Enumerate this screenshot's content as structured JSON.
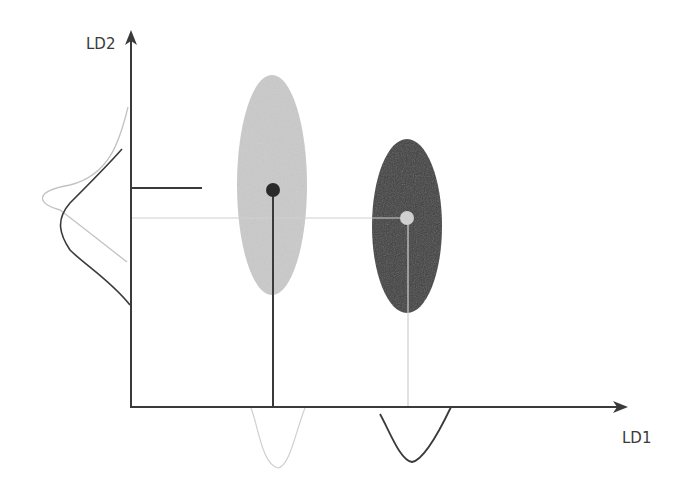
{
  "diagram": {
    "type": "LDA projection illustration",
    "x_axis": {
      "label": "LD1"
    },
    "y_axis": {
      "label": "LD2"
    },
    "classes": [
      {
        "name": "class-light",
        "ellipse_color": "#c8c8c8",
        "centroid_color": "#2a2a2a",
        "centroid": [
          273,
          190
        ]
      },
      {
        "name": "class-dark",
        "ellipse_color": "#3a3a3a",
        "centroid_color": "#cfcfcf",
        "centroid": [
          407,
          218
        ]
      }
    ],
    "colors": {
      "axis": "#3a3a3a",
      "light": "#c8c8c8",
      "dark": "#3a3a3a",
      "background": "#ffffff"
    }
  }
}
